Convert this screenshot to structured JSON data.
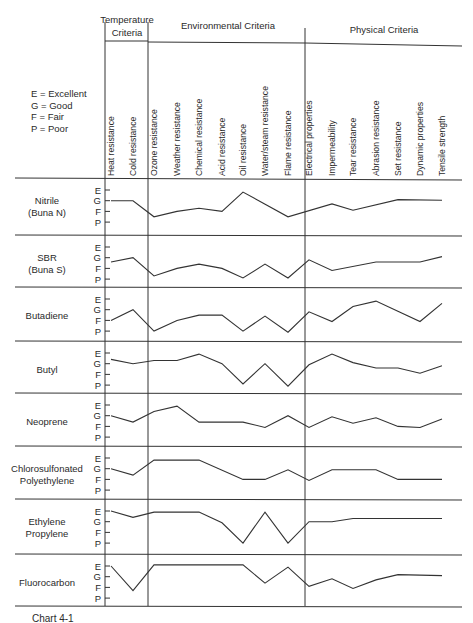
{
  "chart_data": {
    "type": "line",
    "title": "",
    "legend_key": [
      "E = Excellent",
      "G = Good",
      "F = Fair",
      "P = Poor"
    ],
    "rating_scale": {
      "E": 4,
      "G": 3,
      "F": 2,
      "P": 1
    },
    "y_ticks": [
      "E",
      "G",
      "F",
      "P"
    ],
    "groups": [
      {
        "label_lines": [
          "Temperature",
          "Criteria"
        ],
        "columns": [
          "Heat resistance",
          "Cold resistance"
        ]
      },
      {
        "label_lines": [
          "Environmental Criteria"
        ],
        "columns": [
          "Ozone resistance",
          "Weather resistance",
          "Chemical resistance",
          "Acid resistance",
          "Oil resistance",
          "Water/steam resistance",
          "Flame resistance"
        ]
      },
      {
        "label_lines": [
          "Physical Criteria"
        ],
        "columns": [
          "Electrical properties",
          "Impermeability",
          "Tear resistance",
          "Abrasion resistance",
          "Set resistance",
          "Dynamic properties",
          "Tensile strength"
        ]
      }
    ],
    "categories": [
      "Heat resistance",
      "Cold resistance",
      "Ozone resistance",
      "Weather resistance",
      "Chemical resistance",
      "Acid resistance",
      "Oil resistance",
      "Water/steam resistance",
      "Flame resistance",
      "Electrical properties",
      "Impermeability",
      "Tear resistance",
      "Abrasion resistance",
      "Set resistance",
      "Dynamic properties",
      "Tensile strength"
    ],
    "series": [
      {
        "name": "Nitrile (Buna N)",
        "label_lines": [
          "Nitrile",
          "(Buna N)"
        ],
        "values": [
          3,
          3,
          1.5,
          2,
          2.3,
          2,
          3.8,
          null,
          1.5,
          null,
          2.7,
          2.1,
          null,
          3.1,
          3.1,
          3.05
        ],
        "points": [
          [
            0,
            3
          ],
          [
            1,
            3
          ],
          [
            2,
            1.5
          ],
          [
            3,
            2
          ],
          [
            4,
            2.3
          ],
          [
            5,
            2
          ],
          [
            6,
            3.8
          ],
          [
            8,
            1.5
          ],
          [
            10,
            2.7
          ],
          [
            11,
            2.1
          ],
          [
            13,
            3.1
          ],
          [
            15,
            3.05
          ]
        ]
      },
      {
        "name": "SBR (Buna S)",
        "label_lines": [
          "SBR",
          "(Buna S)"
        ],
        "values": [
          2.6,
          3,
          1.3,
          2,
          2.4,
          2,
          1.1,
          2.4,
          1.1,
          2.8,
          1.8,
          null,
          2.6,
          2.6,
          2.6,
          3.1
        ],
        "points": [
          [
            0,
            2.6
          ],
          [
            1,
            3
          ],
          [
            2,
            1.3
          ],
          [
            3,
            2
          ],
          [
            4,
            2.4
          ],
          [
            5,
            2
          ],
          [
            6,
            1.1
          ],
          [
            7,
            2.4
          ],
          [
            8,
            1.1
          ],
          [
            9,
            2.8
          ],
          [
            10,
            1.8
          ],
          [
            12,
            2.6
          ],
          [
            14,
            2.6
          ],
          [
            15,
            3.1
          ]
        ]
      },
      {
        "name": "Butadiene",
        "label_lines": [
          "Butadiene"
        ],
        "values": [
          2,
          3,
          1,
          2,
          2.5,
          2.5,
          1,
          2.4,
          0.9,
          2.8,
          1.9,
          3.3,
          3.8,
          null,
          1.9,
          3.6
        ],
        "points": [
          [
            0,
            2
          ],
          [
            1,
            3
          ],
          [
            2,
            1
          ],
          [
            3,
            2
          ],
          [
            4,
            2.5
          ],
          [
            5,
            2.5
          ],
          [
            6,
            1
          ],
          [
            7,
            2.4
          ],
          [
            8,
            0.9
          ],
          [
            9,
            2.8
          ],
          [
            10,
            1.9
          ],
          [
            11,
            3.3
          ],
          [
            12,
            3.8
          ],
          [
            14,
            1.9
          ],
          [
            15,
            3.6
          ]
        ]
      },
      {
        "name": "Butyl",
        "label_lines": [
          "Butyl"
        ],
        "values": [
          3.4,
          3,
          3.3,
          3.3,
          3.9,
          3,
          1.1,
          3,
          0.9,
          2.9,
          3.9,
          3.1,
          2.6,
          2.6,
          2.1,
          2.8
        ],
        "points": [
          [
            0,
            3.4
          ],
          [
            1,
            3
          ],
          [
            2,
            3.3
          ],
          [
            3,
            3.3
          ],
          [
            4,
            3.9
          ],
          [
            5,
            3
          ],
          [
            6,
            1.1
          ],
          [
            7,
            3
          ],
          [
            8,
            0.9
          ],
          [
            9,
            2.9
          ],
          [
            10,
            3.9
          ],
          [
            11,
            3.1
          ],
          [
            12,
            2.6
          ],
          [
            13,
            2.6
          ],
          [
            14,
            2.1
          ],
          [
            15,
            2.8
          ]
        ]
      },
      {
        "name": "Neoprene",
        "label_lines": [
          "Neoprene"
        ],
        "values": [
          3,
          2.4,
          3.4,
          3.9,
          2.4,
          null,
          2.4,
          1.9,
          3.0,
          1.9,
          2.9,
          2.3,
          2.8,
          2,
          1.9,
          2.7
        ],
        "points": [
          [
            0,
            3
          ],
          [
            1,
            2.4
          ],
          [
            2,
            3.4
          ],
          [
            3,
            3.9
          ],
          [
            4,
            2.4
          ],
          [
            6,
            2.4
          ],
          [
            7,
            1.9
          ],
          [
            8,
            3.0
          ],
          [
            9,
            1.9
          ],
          [
            10,
            2.9
          ],
          [
            11,
            2.3
          ],
          [
            12,
            2.8
          ],
          [
            13,
            2
          ],
          [
            14,
            1.9
          ],
          [
            15,
            2.7
          ]
        ]
      },
      {
        "name": "Chlorosulfonated Polyethylene",
        "label_lines": [
          "Chlorosulfonated",
          "Polyethylene"
        ],
        "values": [
          3,
          2.4,
          3.8,
          null,
          3.8,
          null,
          2,
          2,
          2.9,
          1.9,
          2.9,
          null,
          2.9,
          2,
          null,
          2
        ],
        "points": [
          [
            0,
            3
          ],
          [
            1,
            2.4
          ],
          [
            2,
            3.8
          ],
          [
            4,
            3.8
          ],
          [
            6,
            2
          ],
          [
            7,
            2
          ],
          [
            8,
            2.9
          ],
          [
            9,
            1.9
          ],
          [
            10,
            2.9
          ],
          [
            12,
            2.9
          ],
          [
            13,
            2
          ],
          [
            15,
            2
          ]
        ]
      },
      {
        "name": "Ethylene Propylene",
        "label_lines": [
          "Ethylene",
          "Propylene"
        ],
        "values": [
          4,
          3.4,
          3.9,
          null,
          3.9,
          2.9,
          1,
          3.9,
          1,
          3,
          3,
          3.3,
          null,
          null,
          null,
          3.3
        ],
        "points": [
          [
            0,
            4
          ],
          [
            1,
            3.4
          ],
          [
            2,
            3.9
          ],
          [
            4,
            3.9
          ],
          [
            5,
            2.9
          ],
          [
            6,
            1
          ],
          [
            7,
            3.9
          ],
          [
            8,
            1
          ],
          [
            9,
            3
          ],
          [
            10,
            3
          ],
          [
            11,
            3.3
          ],
          [
            15,
            3.3
          ]
        ]
      },
      {
        "name": "Fluorocarbon",
        "label_lines": [
          "Fluorocarbon"
        ],
        "values": [
          4,
          1.7,
          4.1,
          null,
          null,
          null,
          4.1,
          2.4,
          3.9,
          2.1,
          2.8,
          1.9,
          2.7,
          3.2,
          null,
          3.1
        ],
        "points": [
          [
            0,
            4
          ],
          [
            1,
            1.7
          ],
          [
            2,
            4.1
          ],
          [
            6,
            4.1
          ],
          [
            7,
            2.4
          ],
          [
            8,
            3.9
          ],
          [
            9,
            2.1
          ],
          [
            10,
            2.8
          ],
          [
            11,
            1.9
          ],
          [
            12,
            2.7
          ],
          [
            13,
            3.2
          ],
          [
            15,
            3.1
          ]
        ]
      }
    ],
    "grid": false,
    "legend_position": "top-left"
  },
  "caption": "Chart 4-1"
}
